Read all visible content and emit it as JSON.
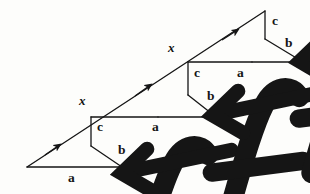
{
  "diagram": {
    "type": "hand-drawn geometry / physics free-body sketch",
    "background_color": "#fdfdfb",
    "ink_color": "#151515",
    "stroke_width": 1.3,
    "units": [
      {
        "name": "lower-left-unit",
        "hypotenuse_label": "F",
        "displacement_label": "x",
        "vertical_label": "c",
        "slant_label": "b",
        "base_label": "a"
      },
      {
        "name": "middle-unit",
        "hypotenuse_label": "F",
        "displacement_label": "x",
        "vertical_label": "c",
        "slant_label": "b",
        "base_label": "a"
      },
      {
        "name": "upper-right-unit",
        "hypotenuse_label": "F",
        "displacement_label": "x",
        "vertical_label": "c",
        "slant_label": "b",
        "base_label": "a"
      }
    ],
    "labels": {
      "force_1": "F",
      "force_2": "F",
      "force_3": "F",
      "x_1": "x",
      "x_2": "x",
      "c_1": "c",
      "c_2": "c",
      "c_3": "c",
      "b_1": "b",
      "b_2": "b",
      "b_3": "b",
      "a_1": "a",
      "a_2": "a",
      "a_3": "a"
    }
  }
}
